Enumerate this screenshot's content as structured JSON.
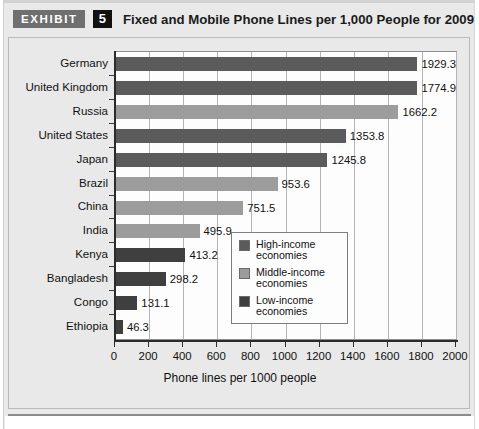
{
  "header": {
    "exhibit_tag": "EXHIBIT",
    "exhibit_number": "5",
    "title": "Fixed and Mobile Phone Lines per 1,000 People for 2009"
  },
  "colors": {
    "high_income": "#5b5b5b",
    "middle_income": "#9c9c9c",
    "low_income": "#3f3f3f",
    "plot_background": "#fdfdfd",
    "page_background": "#e9e9e9",
    "gridline": "#b4b4b4",
    "axis": "#2b2b2b"
  },
  "legend": {
    "items": [
      {
        "label_line1": "High-income",
        "label_line2": "economies",
        "color": "#5b5b5b",
        "key": "high_income"
      },
      {
        "label_line1": "Middle-income",
        "label_line2": "economies",
        "color": "#9c9c9c",
        "key": "middle_income"
      },
      {
        "label_line1": "Low-income",
        "label_line2": "economies",
        "color": "#3f3f3f",
        "key": "low_income"
      }
    ]
  },
  "chart_data": {
    "type": "bar",
    "orientation": "horizontal",
    "title": "Fixed and Mobile Phone Lines per 1,000 People for 2009",
    "xlabel": "Phone lines per 1000 people",
    "ylabel": "",
    "xlim": [
      0,
      2000
    ],
    "xticks": [
      0,
      200,
      400,
      600,
      800,
      1000,
      1200,
      1400,
      1600,
      1800,
      2000
    ],
    "xtick_labels": [
      "0",
      "200",
      "400",
      "600",
      "800",
      "1000",
      "1200",
      "1400",
      "1600",
      "1800",
      "2000"
    ],
    "grid": true,
    "grid_axis": "x",
    "legend_position": "inside-right-lower",
    "categories": [
      "Germany",
      "United Kingdom",
      "Russia",
      "United States",
      "Japan",
      "Brazil",
      "China",
      "India",
      "Kenya",
      "Bangladesh",
      "Congo",
      "Ethiopia"
    ],
    "values": [
      1929.3,
      1774.9,
      1662.2,
      1353.8,
      1245.8,
      953.6,
      751.5,
      495.9,
      413.2,
      298.2,
      131.1,
      46.3
    ],
    "value_labels": [
      "1929.3",
      "1774.9",
      "1662.2",
      "1353.8",
      "1245.8",
      "953.6",
      "751.5",
      "495.9",
      "413.2",
      "298.2",
      "131.1",
      "46.3"
    ],
    "groups": [
      "high_income",
      "high_income",
      "middle_income",
      "high_income",
      "high_income",
      "middle_income",
      "middle_income",
      "middle_income",
      "low_income",
      "low_income",
      "low_income",
      "low_income"
    ],
    "series": [
      {
        "name": "High-income economies",
        "color": "#5b5b5b",
        "points": [
          {
            "category": "Germany",
            "value": 1929.3
          },
          {
            "category": "United Kingdom",
            "value": 1774.9
          },
          {
            "category": "United States",
            "value": 1353.8
          },
          {
            "category": "Japan",
            "value": 1245.8
          }
        ]
      },
      {
        "name": "Middle-income economies",
        "color": "#9c9c9c",
        "points": [
          {
            "category": "Russia",
            "value": 1662.2
          },
          {
            "category": "Brazil",
            "value": 953.6
          },
          {
            "category": "China",
            "value": 751.5
          },
          {
            "category": "India",
            "value": 495.9
          }
        ]
      },
      {
        "name": "Low-income economies",
        "color": "#3f3f3f",
        "points": [
          {
            "category": "Kenya",
            "value": 413.2
          },
          {
            "category": "Bangladesh",
            "value": 298.2
          },
          {
            "category": "Congo",
            "value": 131.1
          },
          {
            "category": "Ethiopia",
            "value": 46.3
          }
        ]
      }
    ]
  }
}
